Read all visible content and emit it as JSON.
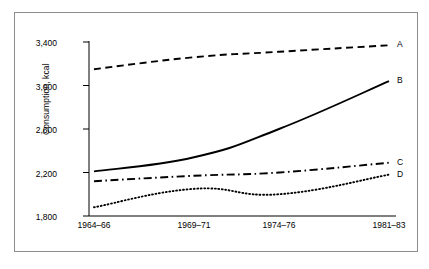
{
  "chart_data": {
    "type": "line",
    "title": "",
    "xlabel": "",
    "ylabel": "Consumption, kcal",
    "categories": [
      "1964–66",
      "1969–71",
      "1974–76",
      "1981–83"
    ],
    "x_tick_labels": [
      "1964–66",
      "1969–71",
      "1974–76",
      "1981–83"
    ],
    "y_tick_labels": [
      "1,800",
      "2,200",
      "2,600",
      "3,000",
      "3,400"
    ],
    "y_ticks": [
      1800,
      2200,
      2600,
      3000,
      3400
    ],
    "ylim": [
      1800,
      3400
    ],
    "grid": false,
    "legend_position": "right-end-of-line",
    "series": [
      {
        "name": "A",
        "label": "A",
        "style": "dashed",
        "color": "#000000",
        "values": [
          3150,
          3260,
          3310,
          3370
        ]
      },
      {
        "name": "B",
        "label": "B",
        "style": "solid",
        "color": "#000000",
        "values": [
          2210,
          2340,
          2600,
          3040
        ]
      },
      {
        "name": "C",
        "label": "C",
        "style": "dashdot",
        "color": "#000000",
        "values": [
          2120,
          2170,
          2200,
          2290
        ]
      },
      {
        "name": "D",
        "label": "D",
        "style": "dotted",
        "color": "#000000",
        "values": [
          1880,
          2050,
          2000,
          2180
        ]
      }
    ]
  },
  "axis": {
    "y_title": "Consumption, kcal"
  },
  "ticks": {
    "y": [
      "3,400",
      "3,000",
      "2,600",
      "2,200",
      "1,800"
    ],
    "x": [
      "1964–66",
      "1969–71",
      "1974–76",
      "1981–83"
    ]
  },
  "labels": {
    "a": "A",
    "b": "B",
    "c": "C",
    "d": "D"
  },
  "colors": {
    "line": "#000000",
    "frame": "#8d8d8d",
    "background": "#ffffff"
  }
}
